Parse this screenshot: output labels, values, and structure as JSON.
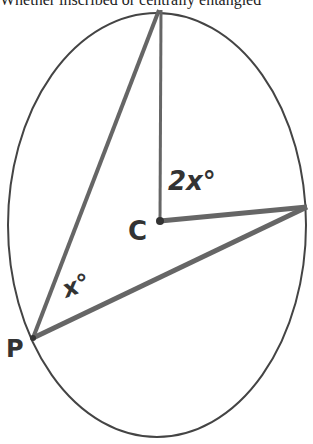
{
  "caption": "Whether inscribed or centrally entangled",
  "diagram": {
    "circle": {
      "cx": 157,
      "cy": 225,
      "rx": 149,
      "ry": 212
    },
    "labels": {
      "center": "C",
      "point": "P",
      "inscribed_angle": "x°",
      "central_angle": "2x°"
    },
    "colors": {
      "stroke": "#555555",
      "ink": "#333333",
      "outline": "#444444"
    }
  }
}
